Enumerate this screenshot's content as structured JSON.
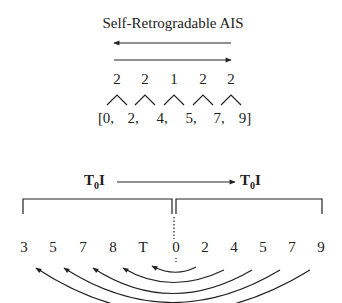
{
  "title": "Self-Retrogradable AIS",
  "interval_series": {
    "intervals": [
      "2",
      "2",
      "1",
      "2",
      "2"
    ],
    "set": [
      "[0,",
      "2,",
      "4,",
      "5,",
      "7,",
      "9]"
    ]
  },
  "transform": {
    "left_label": "T",
    "left_sub": "0",
    "left_suffix": "I",
    "right_label": "T",
    "right_sub": "0",
    "right_suffix": "I"
  },
  "pitch_row": [
    "3",
    "5",
    "7",
    "8",
    "T",
    "0",
    "2",
    "4",
    "5",
    "7",
    "9"
  ],
  "colors": {
    "stroke": "#222222",
    "text": "#222222"
  }
}
